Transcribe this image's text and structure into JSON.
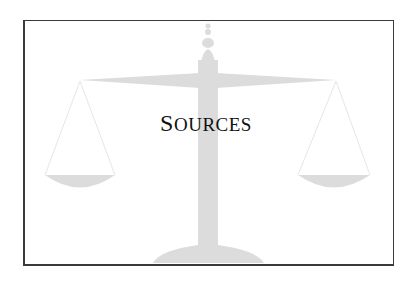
{
  "slide": {
    "title_first": "S",
    "title_rest": "OURCES",
    "title_full": "Sources",
    "illustration": "scales-of-justice-icon",
    "colors": {
      "background": "#ffffff",
      "frame": "#3a3a3a",
      "illustration": "#dcdcdc",
      "text": "#111111"
    }
  }
}
